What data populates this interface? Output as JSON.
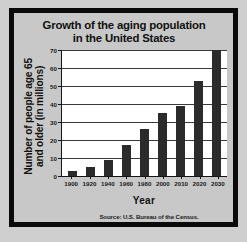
{
  "figure": {
    "background_color": "#cfcfcf",
    "frame_color": "#0a0a0a",
    "panel_color": "#c8c8c8"
  },
  "chart_data": {
    "type": "bar",
    "title": "Growth of the aging population in the United States",
    "title_line_1": "Growth of the aging population",
    "title_line_2": "in the United States",
    "xlabel": "Year",
    "ylabel": "Number of people age 65 and older (in millions)",
    "ylabel_line_1": "Number of people age 65",
    "ylabel_line_2": "and older (in millions)",
    "categories": [
      "1900",
      "1920",
      "1940",
      "1960",
      "1980",
      "2000",
      "2010",
      "2020",
      "2030"
    ],
    "values": [
      3,
      5,
      9,
      17,
      26,
      35,
      39,
      53,
      70
    ],
    "ylim": [
      0,
      70
    ],
    "yticks": [
      0,
      10,
      20,
      30,
      40,
      50,
      60,
      70
    ],
    "ytick_labels": [
      "0",
      "10",
      "20",
      "30",
      "40",
      "50",
      "60",
      "70"
    ],
    "grid": true,
    "legend": false,
    "bar_color": "#2b2b2b",
    "plot_background": "#ffffff",
    "source_note": "Source: U.S. Bureau of the Census."
  }
}
